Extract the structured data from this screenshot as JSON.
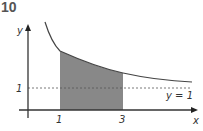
{
  "problem_number": "10",
  "diagram": {
    "axes": {
      "x_label": "x",
      "y_label": "y"
    },
    "ticks": {
      "x": [
        "1",
        "3"
      ],
      "y": [
        "1"
      ]
    },
    "asymptote_label": "y = 1",
    "curve": "decreasing curve approaching y = 1",
    "shaded_region": {
      "from_x": "1",
      "to_x": "3",
      "color": "#888888"
    }
  }
}
